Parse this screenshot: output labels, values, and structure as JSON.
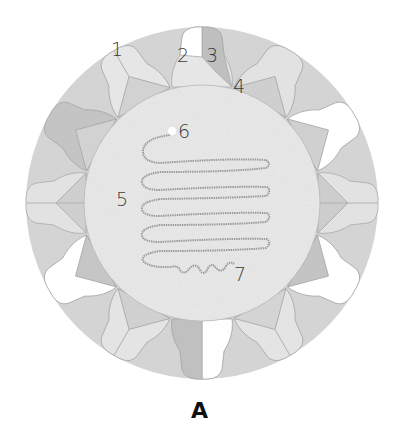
{
  "figure": {
    "caption": "A",
    "colors": {
      "background": "#ffffff",
      "core": "#ebebeb",
      "light": "#e3e3e3",
      "mid": "#d2d2d2",
      "dark": "#bdbdbd",
      "white": "#ffffff",
      "outline": "#a9a9a9",
      "nucleic_acid": "#9a9a9a"
    },
    "labels": [
      {
        "id": "1",
        "text": "1"
      },
      {
        "id": "2",
        "text": "2"
      },
      {
        "id": "3",
        "text": "3"
      },
      {
        "id": "4",
        "text": "4"
      },
      {
        "id": "5",
        "text": "5"
      },
      {
        "id": "6",
        "text": "6"
      },
      {
        "id": "7",
        "text": "7"
      }
    ]
  }
}
